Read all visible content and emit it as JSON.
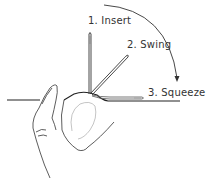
{
  "diagram": {
    "steps": [
      {
        "number": 1,
        "label": "1. Insert"
      },
      {
        "number": 2,
        "label": "2. Swing"
      },
      {
        "number": 3,
        "label": "3. Squeeze"
      }
    ],
    "elements": [
      "hand-thumb",
      "thread-line",
      "needle-vertical",
      "needle-diagonal",
      "needle-horizontal",
      "motion-arc-arrow"
    ],
    "colors": {
      "ink": "#222222",
      "light_ink": "#999999",
      "background": "#ffffff"
    }
  }
}
